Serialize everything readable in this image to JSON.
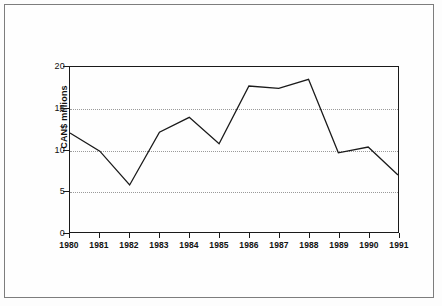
{
  "figure": {
    "background_color": "#fefefe",
    "frame_color": "#7d7d7d",
    "line_color": "#1a1a1a",
    "grid_color": "#9a9a9a"
  },
  "chart_data": {
    "type": "line",
    "title": "",
    "xlabel": "",
    "ylabel": "CAN$ millions",
    "categories": [
      "1980",
      "1981",
      "1982",
      "1983",
      "1984",
      "1985",
      "1986",
      "1987",
      "1988",
      "1989",
      "1990",
      "1991"
    ],
    "values": [
      12.0,
      9.8,
      5.7,
      12.1,
      13.9,
      10.7,
      17.7,
      17.4,
      18.5,
      9.6,
      10.3,
      6.9
    ],
    "series": [
      {
        "name": "CAN$ millions",
        "values": [
          12.0,
          9.8,
          5.7,
          12.1,
          13.9,
          10.7,
          17.7,
          17.4,
          18.5,
          9.6,
          10.3,
          6.9
        ],
        "color": "#1a1a1a"
      }
    ],
    "ylim": [
      0,
      20
    ],
    "yticks": [
      0,
      5,
      10,
      15,
      20
    ],
    "ytick_labels": [
      "0",
      "5",
      "10",
      "15",
      "20"
    ],
    "gridlines_y": [
      5,
      10,
      15
    ],
    "grid": true,
    "grid_style": "dotted",
    "legend": false,
    "legend_position": "none",
    "markers": false
  }
}
